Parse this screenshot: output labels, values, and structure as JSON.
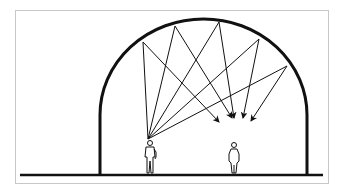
{
  "diagram": {
    "type": "acoustic-reflection",
    "colors": {
      "stroke": "#111111",
      "frame": "#c8c8c8",
      "background": "#ffffff"
    },
    "ground": {
      "x1": 20,
      "x2": 323,
      "y": 175
    },
    "dome": {
      "left_x": 100,
      "right_x": 307,
      "spring_y": 115,
      "top_y": 19
    },
    "source": {
      "x": 148,
      "y": 139
    },
    "rays": [
      {
        "reflect": [
          143,
          42
        ],
        "target": [
          219,
          122
        ]
      },
      {
        "reflect": [
          175,
          26
        ],
        "target": [
          232,
          118
        ]
      },
      {
        "reflect": [
          219,
          22
        ],
        "target": [
          234,
          118
        ]
      },
      {
        "reflect": [
          259,
          39
        ],
        "target": [
          243,
          118
        ]
      },
      {
        "reflect": [
          287,
          66
        ],
        "target": [
          251,
          121
        ]
      }
    ],
    "figures": [
      {
        "name": "speaker",
        "x": 150
      },
      {
        "name": "listener",
        "x": 234
      }
    ]
  }
}
